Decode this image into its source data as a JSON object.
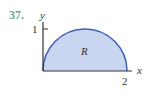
{
  "problem_number": "37.",
  "axes": {
    "x_label": "x",
    "y_label": "y"
  },
  "ticks": {
    "y_tick": "1",
    "x_tick": "2"
  },
  "region_label": "R",
  "colors": {
    "fill": "#c9d6ef",
    "stroke": "#3e62b8",
    "number": "#6aa88a"
  }
}
